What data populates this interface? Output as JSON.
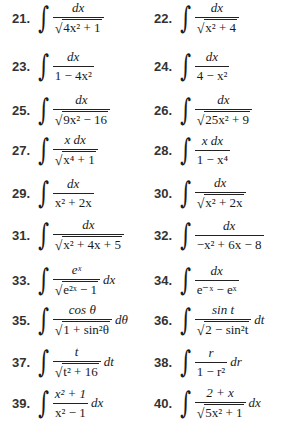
{
  "problems": [
    {
      "number": "21.",
      "numerator": "dx",
      "denominator": "4x² + 1",
      "sqrt": true,
      "tail": ""
    },
    {
      "number": "22.",
      "numerator": "dx",
      "denominator": "x² + 4",
      "sqrt": true,
      "tail": ""
    },
    {
      "number": "23.",
      "numerator": "dx",
      "denominator": "1 − 4x²",
      "sqrt": false,
      "tail": ""
    },
    {
      "number": "24.",
      "numerator": "dx",
      "denominator": "4 − x²",
      "sqrt": false,
      "tail": ""
    },
    {
      "number": "25.",
      "numerator": "dx",
      "denominator": "9x² − 16",
      "sqrt": true,
      "tail": ""
    },
    {
      "number": "26.",
      "numerator": "dx",
      "denominator": "25x² + 9",
      "sqrt": true,
      "tail": ""
    },
    {
      "number": "27.",
      "numerator": "x dx",
      "denominator": "x⁴ + 1",
      "sqrt": true,
      "tail": ""
    },
    {
      "number": "28.",
      "numerator": "x dx",
      "denominator": "1 − x⁴",
      "sqrt": false,
      "tail": ""
    },
    {
      "number": "29.",
      "numerator": "dx",
      "denominator": "x² + 2x",
      "sqrt": false,
      "tail": ""
    },
    {
      "number": "30.",
      "numerator": "dx",
      "denominator": "x² + 2x",
      "sqrt": true,
      "tail": ""
    },
    {
      "number": "31.",
      "numerator": "dx",
      "denominator": "x² + 4x + 5",
      "sqrt": true,
      "tail": ""
    },
    {
      "number": "32.",
      "numerator": "dx",
      "denominator": "−x² + 6x − 8",
      "sqrt": false,
      "tail": ""
    },
    {
      "number": "33.",
      "numerator": "eˣ",
      "denominator": "e²ˣ − 1",
      "sqrt": true,
      "tail": "dx"
    },
    {
      "number": "34.",
      "numerator": "dx",
      "denominator": "e⁻ˣ − eˣ",
      "sqrt": false,
      "tail": ""
    },
    {
      "number": "35.",
      "numerator": "cos θ",
      "denominator": "1 + sin²θ",
      "sqrt": true,
      "tail": "dθ"
    },
    {
      "number": "36.",
      "numerator": "sin t",
      "denominator": "2 − sin²t",
      "sqrt": true,
      "tail": "dt"
    },
    {
      "number": "37.",
      "numerator": "t",
      "denominator": "t² + 16",
      "sqrt": true,
      "tail": "dt"
    },
    {
      "number": "38.",
      "numerator": "r",
      "denominator": "1 − r²",
      "sqrt": false,
      "tail": "dr"
    },
    {
      "number": "39.",
      "numerator": "x² + 1",
      "denominator": "x² − 1",
      "sqrt": false,
      "tail": "dx"
    },
    {
      "number": "40.",
      "numerator": "2 + x",
      "denominator": "5x² + 1",
      "sqrt": true,
      "tail": "dx"
    }
  ],
  "symbols": {
    "integral": "∫",
    "radical": "√"
  }
}
